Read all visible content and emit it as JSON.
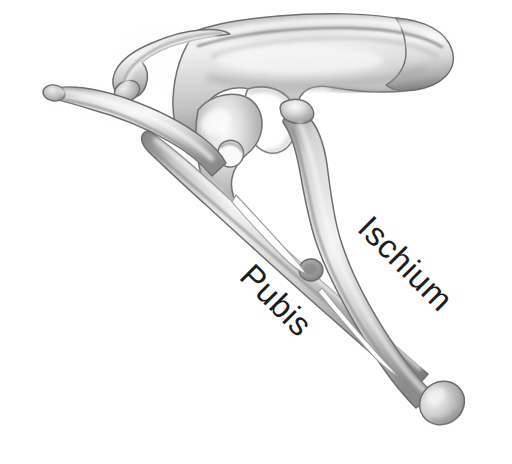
{
  "figure": {
    "background_color": "#ffffff",
    "ink_color": "#1c1c1c",
    "bone_light": "#f2f2f2",
    "bone_mid": "#d2d2d2",
    "bone_shadow": "#9a9a9a",
    "bone_outline": "#6e6e6e",
    "width": 512,
    "height": 464
  },
  "labels": [
    {
      "id": "pubis",
      "text": "Pubis",
      "rotation_deg": 45,
      "x": 238,
      "y": 278,
      "font_size": 33,
      "color": "#1c1c1c"
    },
    {
      "id": "ischium",
      "text": "Ischium",
      "rotation_deg": 45,
      "x": 356,
      "y": 230,
      "font_size": 33,
      "color": "#1c1c1c"
    }
  ],
  "structures": [
    {
      "id": "ilium",
      "name": "Ilium (upper blade)"
    },
    {
      "id": "anterior-process",
      "name": "Preacetabular process"
    },
    {
      "id": "posterior-blade",
      "name": "Postacetabular blade"
    },
    {
      "id": "acetabulum",
      "name": "Acetabulum (hip socket opening)"
    },
    {
      "id": "prepubic-process",
      "name": "Prepubic process"
    },
    {
      "id": "pubis-shaft",
      "name": "Pubic shaft"
    },
    {
      "id": "pubic-tubercle",
      "name": "Pubic tubercle"
    },
    {
      "id": "ischium-shaft",
      "name": "Ischial shaft"
    },
    {
      "id": "ischial-boot",
      "name": "Ischial boot (distal expansion)"
    },
    {
      "id": "obturator-gap",
      "name": "Gap between pubic and ischial shafts"
    }
  ]
}
